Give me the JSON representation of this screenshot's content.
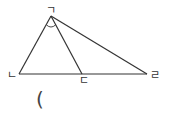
{
  "diagram": {
    "type": "triangle-with-cevian",
    "stroke_color": "#333333",
    "vertices": {
      "top": {
        "label": "ㄱ",
        "x": 51,
        "y": 16
      },
      "left": {
        "label": "ㄴ",
        "x": 19,
        "y": 74
      },
      "middle": {
        "label": "ㄷ",
        "x": 82,
        "y": 74
      },
      "right": {
        "label": "ㄹ",
        "x": 147,
        "y": 74
      }
    },
    "angle_mark": "arc at ㄱ between ㄴ and ㄷ",
    "bracket": "("
  }
}
